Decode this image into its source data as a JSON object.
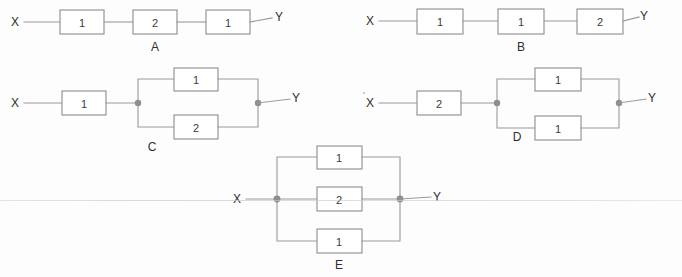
{
  "diagram": {
    "terminal_left": "X",
    "terminal_right": "Y",
    "wire_color": "#9a9a9a",
    "box_border_color": "#8d8d8d",
    "text_color": "#2e2e2e",
    "background_color": "#fdfdfd"
  },
  "circuits": [
    {
      "name": "A",
      "type": "series",
      "left_terminal": "X",
      "right_terminal": "Y",
      "boxes": [
        {
          "value": "1"
        },
        {
          "value": "2"
        },
        {
          "value": "1"
        }
      ]
    },
    {
      "name": "B",
      "type": "series",
      "left_terminal": "X",
      "right_terminal": "Y",
      "boxes": [
        {
          "value": "1"
        },
        {
          "value": "1"
        },
        {
          "value": "2"
        }
      ]
    },
    {
      "name": "C",
      "type": "series-parallel",
      "left_terminal": "X",
      "right_terminal": "Y",
      "series_box": {
        "value": "1"
      },
      "parallel_boxes": [
        {
          "value": "1"
        },
        {
          "value": "2"
        }
      ]
    },
    {
      "name": "D",
      "type": "series-parallel",
      "left_terminal": "X",
      "right_terminal": "Y",
      "series_box": {
        "value": "2"
      },
      "parallel_boxes": [
        {
          "value": "1"
        },
        {
          "value": "1"
        }
      ]
    },
    {
      "name": "E",
      "type": "parallel",
      "left_terminal": "X",
      "right_terminal": "Y",
      "parallel_boxes": [
        {
          "value": "1"
        },
        {
          "value": "2"
        },
        {
          "value": "1"
        }
      ]
    }
  ]
}
